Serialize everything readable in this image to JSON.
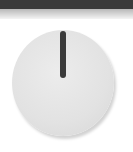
{
  "knob": {
    "label": "",
    "value_angle_deg": 0,
    "colors": {
      "top_bar": "#3a3a3a",
      "knob_face": "#e4e4e4",
      "indicator": "#3b3b3b"
    }
  }
}
